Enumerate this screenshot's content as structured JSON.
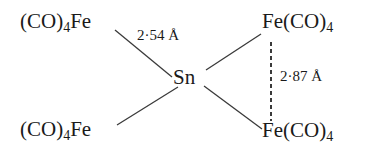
{
  "diagram": {
    "type": "chemical-structure",
    "central_atom": {
      "label": "Sn"
    },
    "groups": [
      {
        "id": "top-left",
        "prefix": "(CO)",
        "subscript": "4",
        "suffix": "Fe",
        "orientation": "ligand-first"
      },
      {
        "id": "top-right",
        "prefix": "Fe(CO)",
        "subscript": "4",
        "suffix": "",
        "orientation": "metal-first"
      },
      {
        "id": "bottom-left",
        "prefix": "(CO)",
        "subscript": "4",
        "suffix": "Fe",
        "orientation": "ligand-first"
      },
      {
        "id": "bottom-right",
        "prefix": "Fe(CO)",
        "subscript": "4",
        "suffix": "",
        "orientation": "metal-first"
      }
    ],
    "bonds": [
      {
        "from": "top-left",
        "to": "Sn",
        "style": "solid"
      },
      {
        "from": "top-right",
        "to": "Sn",
        "style": "solid"
      },
      {
        "from": "bottom-left",
        "to": "Sn",
        "style": "solid"
      },
      {
        "from": "bottom-right",
        "to": "Sn",
        "style": "solid"
      },
      {
        "from": "top-right",
        "to": "bottom-right",
        "style": "dashed"
      }
    ],
    "distances": [
      {
        "bond": "Fe-Sn",
        "label": "2·54 Å"
      },
      {
        "bond": "Fe-Fe",
        "label": "2·87 Å"
      }
    ],
    "colors": {
      "ink": "#1a1a1a",
      "bond": "#3a3a3a",
      "background": "#ffffff"
    }
  }
}
